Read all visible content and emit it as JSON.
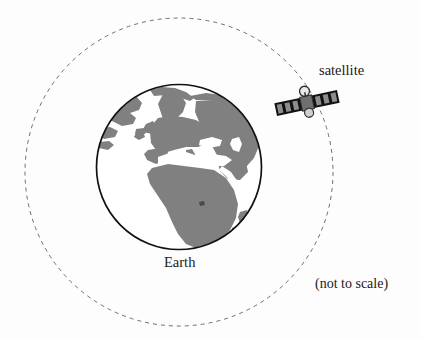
{
  "figure": {
    "background_color": "#fdfdfd",
    "width": 421,
    "height": 340
  },
  "labels": {
    "satellite": "satellite",
    "earth": "Earth",
    "scale_note": "(not to scale)"
  },
  "diagram": {
    "orbit": {
      "name": "orbit-path",
      "shape": "circle",
      "style": "dashed",
      "center_x": 179,
      "center_y": 172,
      "radius": 154,
      "stroke_color": "#6e6e6e",
      "stroke_width": 1,
      "dash_pattern": "4 4"
    },
    "earth": {
      "name": "earth-globe",
      "shape": "circle",
      "center_x": 179,
      "center_y": 167,
      "radius": 83,
      "ocean_color": "#ffffff",
      "land_color": "#808080",
      "outline_color": "#111111",
      "outline_width": 1.6,
      "visible_region": "Europe, Africa, Middle East, western Asia"
    },
    "satellite": {
      "name": "satellite-body",
      "center_x": 307,
      "center_y": 103,
      "rotation_deg": -12,
      "panel_color": "#121212",
      "cell_color": "#8d8d8d",
      "body_color": "#6f6f6f",
      "span_px": 64,
      "on_orbit": true
    }
  }
}
